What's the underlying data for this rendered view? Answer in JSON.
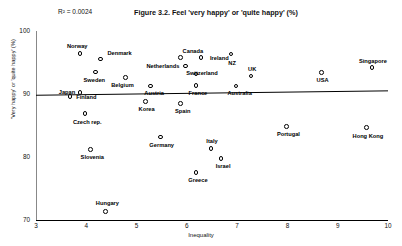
{
  "chart_data": {
    "type": "scatter",
    "title": "Figure 3.2. Feel 'very happy' or 'quite happy' (%)",
    "annotation": "R² = 0.0024",
    "xlabel": "Inequality",
    "ylabel": "'Very happy' or 'quite happy' (%)",
    "xlim": [
      3,
      10
    ],
    "ylim": [
      70,
      100
    ],
    "xticks": [
      "3",
      "4",
      "5",
      "6",
      "7",
      "8",
      "9",
      "10"
    ],
    "yticks": [
      "70",
      "80",
      "90",
      "100"
    ],
    "grid": false,
    "legend": null,
    "marker": "open-circle",
    "trendline": {
      "x0": 3.0,
      "y0": 89.8,
      "x1": 10.0,
      "y1": 90.5
    },
    "points": [
      {
        "label": "Norway",
        "x": 3.9,
        "y": 96.3,
        "lx": 3.82,
        "ly": 97.6,
        "anchor": "center"
      },
      {
        "label": "Denmark",
        "x": 4.3,
        "y": 95.4,
        "lx": 4.42,
        "ly": 96.4,
        "anchor": "left"
      },
      {
        "label": "Canada",
        "x": 5.9,
        "y": 95.6,
        "lx": 6.12,
        "ly": 96.8,
        "anchor": "center"
      },
      {
        "label": "Ireland",
        "x": 6.3,
        "y": 95.6,
        "lx": 6.46,
        "ly": 95.6,
        "anchor": "left"
      },
      {
        "label": "NZ",
        "x": 6.9,
        "y": 96.2,
        "lx": 6.9,
        "ly": 94.9,
        "anchor": "center"
      },
      {
        "label": "Singapore",
        "x": 9.7,
        "y": 94.0,
        "lx": 9.7,
        "ly": 95.2,
        "anchor": "center"
      },
      {
        "label": "Sweden",
        "x": 4.2,
        "y": 93.3,
        "lx": 4.16,
        "ly": 92.2,
        "anchor": "center"
      },
      {
        "label": "Netherlands",
        "x": 6.0,
        "y": 94.3,
        "lx": 5.85,
        "ly": 94.3,
        "anchor": "right"
      },
      {
        "label": "Switzerland",
        "x": 6.2,
        "y": 93.0,
        "lx": 6.3,
        "ly": 93.2,
        "anchor": "center"
      },
      {
        "label": "UK",
        "x": 7.3,
        "y": 92.7,
        "lx": 7.3,
        "ly": 93.8,
        "anchor": "center"
      },
      {
        "label": "USA",
        "x": 8.7,
        "y": 93.2,
        "lx": 8.7,
        "ly": 92.1,
        "anchor": "center"
      },
      {
        "label": "Belgium",
        "x": 4.8,
        "y": 92.4,
        "lx": 4.72,
        "ly": 91.3,
        "anchor": "center"
      },
      {
        "label": "Austria",
        "x": 5.3,
        "y": 91.1,
        "lx": 5.35,
        "ly": 90.0,
        "anchor": "center"
      },
      {
        "label": "France",
        "x": 6.2,
        "y": 91.2,
        "lx": 6.22,
        "ly": 90.1,
        "anchor": "center"
      },
      {
        "label": "Australia",
        "x": 7.0,
        "y": 91.1,
        "lx": 7.05,
        "ly": 90.0,
        "anchor": "center"
      },
      {
        "label": "Japan",
        "x": 3.9,
        "y": 90.1,
        "lx": 3.78,
        "ly": 90.3,
        "anchor": "right"
      },
      {
        "label": "Finland",
        "x": 3.7,
        "y": 89.4,
        "lx": 3.8,
        "ly": 89.4,
        "anchor": "left"
      },
      {
        "label": "Korea",
        "x": 5.2,
        "y": 88.6,
        "lx": 5.2,
        "ly": 87.5,
        "anchor": "center"
      },
      {
        "label": "Spain",
        "x": 5.9,
        "y": 88.3,
        "lx": 5.92,
        "ly": 87.2,
        "anchor": "center"
      },
      {
        "label": "Czech rep.",
        "x": 4.0,
        "y": 86.7,
        "lx": 4.02,
        "ly": 85.5,
        "anchor": "center"
      },
      {
        "label": "Germany",
        "x": 5.5,
        "y": 83.0,
        "lx": 5.5,
        "ly": 81.8,
        "anchor": "center"
      },
      {
        "label": "Portugal",
        "x": 8.0,
        "y": 84.7,
        "lx": 8.02,
        "ly": 83.6,
        "anchor": "center"
      },
      {
        "label": "Hong Kong",
        "x": 9.6,
        "y": 84.5,
        "lx": 9.6,
        "ly": 83.3,
        "anchor": "center"
      },
      {
        "label": "Slovenia",
        "x": 4.1,
        "y": 81.0,
        "lx": 4.12,
        "ly": 79.9,
        "anchor": "center"
      },
      {
        "label": "Italy",
        "x": 6.5,
        "y": 81.2,
        "lx": 6.5,
        "ly": 82.4,
        "anchor": "center"
      },
      {
        "label": "Israel",
        "x": 6.7,
        "y": 79.6,
        "lx": 6.72,
        "ly": 78.4,
        "anchor": "center"
      },
      {
        "label": "Greece",
        "x": 6.2,
        "y": 77.4,
        "lx": 6.22,
        "ly": 76.2,
        "anchor": "center"
      },
      {
        "label": "Hungary",
        "x": 4.4,
        "y": 71.2,
        "lx": 4.42,
        "ly": 72.6,
        "anchor": "center"
      }
    ]
  }
}
